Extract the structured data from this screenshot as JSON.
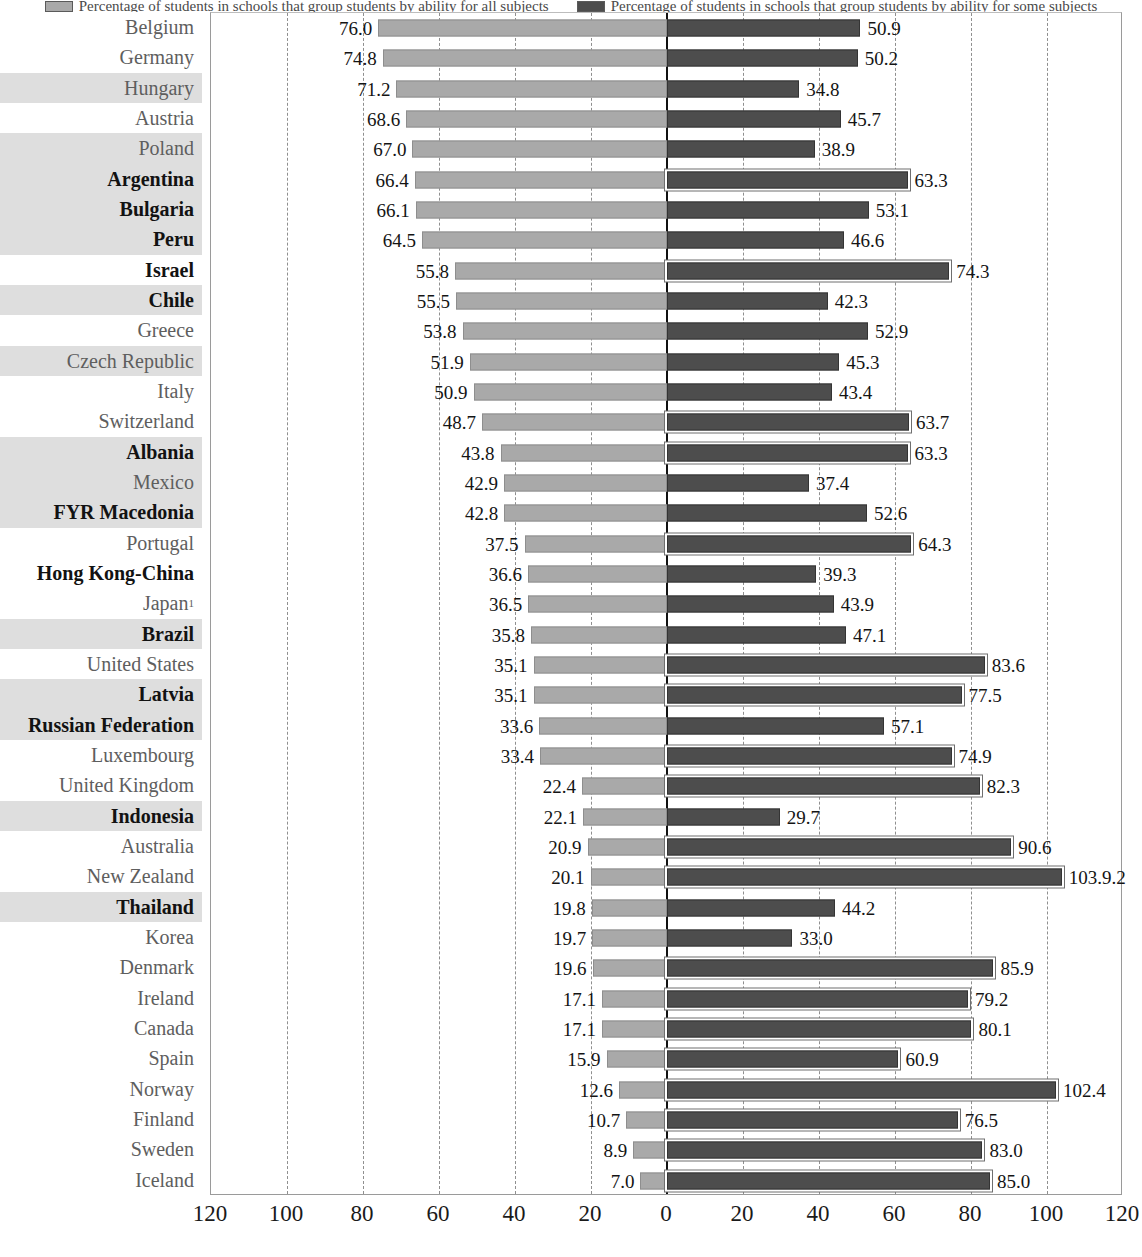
{
  "legend": {
    "items": [
      {
        "swatch": "left-series-swatch",
        "label": "Percentage of students in schools that group students by ability for all subjects"
      },
      {
        "swatch": "right-series-swatch",
        "label": "Percentage of students in schools that group students by ability for some subjects"
      }
    ]
  },
  "axis": {
    "ticks": [
      "120",
      "100",
      "80",
      "60",
      "40",
      "20",
      "0",
      "20",
      "40",
      "60",
      "80",
      "100",
      "120"
    ],
    "min": -120,
    "max": 120,
    "tick_step": 20
  },
  "chart_data": {
    "type": "bar",
    "orientation": "horizontal",
    "layout": "diverging-tornado",
    "title": "",
    "xlabel": "",
    "ylabel": "",
    "xlim": [
      -120,
      120
    ],
    "grid": "vertical-dashed-every-20",
    "legend_position": "top-center",
    "categories": [
      "Belgium",
      "Germany",
      "Hungary",
      "Austria",
      "Poland",
      "Argentina",
      "Bulgaria",
      "Peru",
      "Israel",
      "Chile",
      "Greece",
      "Czech Republic",
      "Italy",
      "Switzerland",
      "Albania",
      "Mexico",
      "FYR Macedonia",
      "Portugal",
      "Hong Kong-China",
      "Japan",
      "Brazil",
      "United States",
      "Latvia",
      "Russian Federation",
      "Luxembourg",
      "United Kingdom",
      "Indonesia",
      "Australia",
      "New Zealand",
      "Thailand",
      "Korea",
      "Denmark",
      "Ireland",
      "Canada",
      "Spain",
      "Norway",
      "Finland",
      "Sweden",
      "Iceland"
    ],
    "series": [
      {
        "name": "left-series",
        "side": "left",
        "values": [
          76.0,
          74.8,
          71.2,
          68.6,
          67.0,
          66.4,
          66.1,
          64.5,
          55.8,
          55.5,
          53.8,
          51.9,
          50.9,
          48.7,
          43.8,
          42.9,
          42.8,
          37.5,
          36.6,
          36.5,
          35.8,
          35.1,
          35.1,
          33.6,
          33.4,
          22.4,
          22.1,
          20.9,
          20.1,
          19.8,
          19.7,
          19.6,
          17.1,
          17.1,
          15.9,
          12.6,
          10.7,
          8.9,
          7.0
        ],
        "labels": [
          "76.0",
          "74.8",
          "71.2",
          "68.6",
          "67.0",
          "66.4",
          "66.1",
          "64.5",
          "55.8",
          "55.5",
          "53.8",
          "51.9",
          "50.9",
          "48.7",
          "43.8",
          "42.9",
          "42.8",
          "37.5",
          "36.6",
          "36.5",
          "35.8",
          "35.1",
          "35.1",
          "33.6",
          "33.4",
          "22.4",
          "22.1",
          "20.9",
          "20.1",
          "19.8",
          "19.7",
          "19.6",
          "17.1",
          "17.1",
          "15.9",
          "12.6",
          "10.7",
          "8.9",
          "7.0"
        ]
      },
      {
        "name": "right-series",
        "side": "right",
        "values": [
          50.9,
          50.2,
          34.8,
          45.7,
          38.9,
          63.3,
          53.1,
          46.6,
          74.3,
          42.3,
          52.9,
          45.3,
          43.4,
          63.7,
          63.3,
          37.4,
          52.6,
          64.3,
          39.3,
          43.9,
          47.1,
          83.6,
          77.5,
          57.1,
          74.9,
          82.3,
          29.7,
          90.6,
          103.9,
          44.2,
          33.0,
          85.9,
          79.2,
          80.1,
          60.9,
          102.4,
          76.5,
          83.0,
          85.0
        ],
        "labels": [
          "50.9",
          "50.2",
          "34.8",
          "45.7",
          "38.9",
          "63.3",
          "53.1",
          "46.6",
          "74.3",
          "42.3",
          "52.9",
          "45.3",
          "43.4",
          "63.7",
          "63.3",
          "37.4",
          "52.6",
          "64.3",
          "39.3",
          "43.9",
          "47.1",
          "83.6",
          "77.5",
          "57.1",
          "74.9",
          "82.3",
          "29.7",
          "90.6",
          "103.9.2",
          "44.2",
          "33.0",
          "85.9",
          "79.2",
          "80.1",
          "60.9",
          "102.4",
          "76.5",
          "83.0",
          "85.0"
        ]
      }
    ]
  },
  "rows": [
    {
      "label": "Belgium",
      "footnote": "",
      "emphasis": "member",
      "band": "none"
    },
    {
      "label": "Germany",
      "footnote": "",
      "emphasis": "member",
      "band": "none"
    },
    {
      "label": "Hungary",
      "footnote": "",
      "emphasis": "member",
      "band": "soft"
    },
    {
      "label": "Austria",
      "footnote": "",
      "emphasis": "member",
      "band": "none"
    },
    {
      "label": "Poland",
      "footnote": "",
      "emphasis": "member",
      "band": "soft"
    },
    {
      "label": "Argentina",
      "footnote": "",
      "emphasis": "partner",
      "band": "soft"
    },
    {
      "label": "Bulgaria",
      "footnote": "",
      "emphasis": "partner",
      "band": "soft"
    },
    {
      "label": "Peru",
      "footnote": "",
      "emphasis": "partner",
      "band": "soft"
    },
    {
      "label": "Israel",
      "footnote": "",
      "emphasis": "partner",
      "band": "none"
    },
    {
      "label": "Chile",
      "footnote": "",
      "emphasis": "partner",
      "band": "soft"
    },
    {
      "label": "Greece",
      "footnote": "",
      "emphasis": "member",
      "band": "none"
    },
    {
      "label": "Czech Republic",
      "footnote": "",
      "emphasis": "member",
      "band": "soft"
    },
    {
      "label": "Italy",
      "footnote": "",
      "emphasis": "member",
      "band": "none"
    },
    {
      "label": "Switzerland",
      "footnote": "",
      "emphasis": "member",
      "band": "none"
    },
    {
      "label": "Albania",
      "footnote": "",
      "emphasis": "partner",
      "band": "soft"
    },
    {
      "label": "Mexico",
      "footnote": "",
      "emphasis": "member",
      "band": "soft"
    },
    {
      "label": "FYR Macedonia",
      "footnote": "",
      "emphasis": "partner",
      "band": "soft"
    },
    {
      "label": "Portugal",
      "footnote": "",
      "emphasis": "member",
      "band": "none"
    },
    {
      "label": "Hong Kong-China",
      "footnote": "",
      "emphasis": "partner",
      "band": "none"
    },
    {
      "label": "Japan",
      "footnote": "1",
      "emphasis": "member",
      "band": "none"
    },
    {
      "label": "Brazil",
      "footnote": "",
      "emphasis": "partner",
      "band": "soft"
    },
    {
      "label": "United States",
      "footnote": "",
      "emphasis": "member",
      "band": "none"
    },
    {
      "label": "Latvia",
      "footnote": "",
      "emphasis": "partner",
      "band": "soft"
    },
    {
      "label": "Russian Federation",
      "footnote": "",
      "emphasis": "partner",
      "band": "soft"
    },
    {
      "label": "Luxembourg",
      "footnote": "",
      "emphasis": "member",
      "band": "none"
    },
    {
      "label": "United Kingdom",
      "footnote": "",
      "emphasis": "member",
      "band": "none"
    },
    {
      "label": "Indonesia",
      "footnote": "",
      "emphasis": "partner",
      "band": "soft"
    },
    {
      "label": "Australia",
      "footnote": "",
      "emphasis": "member",
      "band": "none"
    },
    {
      "label": "New Zealand",
      "footnote": "",
      "emphasis": "member",
      "band": "none"
    },
    {
      "label": "Thailand",
      "footnote": "",
      "emphasis": "partner",
      "band": "soft"
    },
    {
      "label": "Korea",
      "footnote": "",
      "emphasis": "member",
      "band": "none"
    },
    {
      "label": "Denmark",
      "footnote": "",
      "emphasis": "member",
      "band": "none"
    },
    {
      "label": "Ireland",
      "footnote": "",
      "emphasis": "member",
      "band": "none"
    },
    {
      "label": "Canada",
      "footnote": "",
      "emphasis": "member",
      "band": "none"
    },
    {
      "label": "Spain",
      "footnote": "",
      "emphasis": "member",
      "band": "none"
    },
    {
      "label": "Norway",
      "footnote": "",
      "emphasis": "member",
      "band": "none"
    },
    {
      "label": "Finland",
      "footnote": "",
      "emphasis": "member",
      "band": "none"
    },
    {
      "label": "Sweden",
      "footnote": "",
      "emphasis": "member",
      "band": "none"
    },
    {
      "label": "Iceland",
      "footnote": "",
      "emphasis": "member",
      "band": "none"
    }
  ],
  "colors": {
    "left_bar": "#a9a9a9",
    "right_bar": "#4d4d4d",
    "zero_axis": "#111111",
    "gridline": "#8f8f8f",
    "band": "#cfcfcf",
    "partner_text": "#121212",
    "member_text": "#5e5e5e"
  }
}
